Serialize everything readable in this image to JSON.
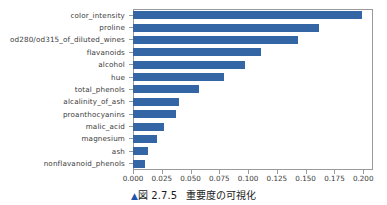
{
  "caption": {
    "marker": "▲",
    "figure_label": "図 2.7.5",
    "title": "重要度の可視化"
  },
  "chart_data": {
    "type": "bar",
    "orientation": "horizontal",
    "title": "",
    "xlabel": "",
    "ylabel": "",
    "grid": false,
    "legend": null,
    "bar_color": "#3465a4",
    "xlim": [
      0.0,
      0.2085
    ],
    "xticks": [
      0.0,
      0.025,
      0.05,
      0.075,
      0.1,
      0.125,
      0.15,
      0.175,
      0.2
    ],
    "xtick_labels": [
      "0.000",
      "0.025",
      "0.050",
      "0.075",
      "0.100",
      "0.125",
      "0.150",
      "0.175",
      "0.200"
    ],
    "categories": [
      "color_intensity",
      "proline",
      "od280/od315_of_diluted_wines",
      "flavanoids",
      "alcohol",
      "hue",
      "total_phenols",
      "alcalinity_of_ash",
      "proanthocyanins",
      "malic_acid",
      "magnesium",
      "ash",
      "nonflavanoid_phenols"
    ],
    "values": [
      0.199,
      0.162,
      0.143,
      0.111,
      0.097,
      0.079,
      0.057,
      0.04,
      0.037,
      0.027,
      0.021,
      0.013,
      0.01
    ]
  }
}
